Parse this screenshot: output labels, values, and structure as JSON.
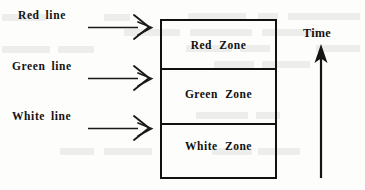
{
  "figure": {
    "background_color": "#fdfdfc",
    "ink_color": "#111111"
  },
  "side_labels": [
    {
      "id": "red-line",
      "text": "Red  line",
      "points_to": "Red Zone",
      "arrow": "double-chevron-right"
    },
    {
      "id": "green-line",
      "text": "Green  line",
      "points_to": "Green Zone",
      "arrow": "double-chevron-right"
    },
    {
      "id": "white-line",
      "text": "White  line",
      "points_to": "White Zone",
      "arrow": "double-chevron-right"
    }
  ],
  "zone_box": {
    "zones": [
      {
        "id": "red-zone",
        "label": "Red   Zone"
      },
      {
        "id": "green-zone",
        "label": "Green  Zone"
      },
      {
        "id": "white-zone",
        "label": "White  Zone"
      }
    ]
  },
  "time_axis": {
    "label": "Time",
    "direction": "up",
    "arrow": "solid-filled-arrowhead"
  }
}
